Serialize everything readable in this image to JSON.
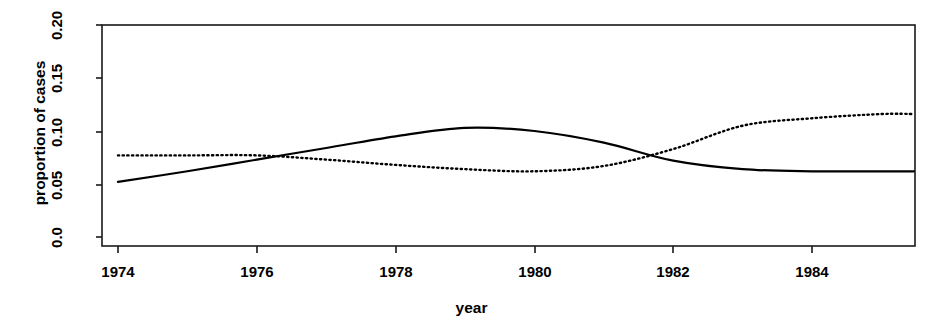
{
  "chart_data": {
    "type": "line",
    "title": "",
    "subtitle": "",
    "xlabel": "year",
    "ylabel": "proportion of cases",
    "x": [
      1974,
      1975,
      1976,
      1977,
      1978,
      1979,
      1980,
      1981,
      1982,
      1983,
      1984,
      1985
    ],
    "xlim": [
      1974,
      1985
    ],
    "ylim": [
      0.0,
      0.2
    ],
    "xticks": [
      1974,
      1976,
      1978,
      1980,
      1982,
      1984
    ],
    "xticklabels": [
      "1974",
      "1976",
      "1978",
      "1980",
      "1982",
      "1984"
    ],
    "yticks": [
      0.0,
      0.05,
      0.1,
      0.15,
      0.2
    ],
    "yticklabels": [
      "0.0",
      "0.05",
      "0.10",
      "0.15",
      "0.20"
    ],
    "grid": false,
    "legend": "none",
    "series": [
      {
        "name": "series-solid",
        "style": "solid",
        "color": "#000000",
        "values": [
          0.052,
          0.062,
          0.073,
          0.084,
          0.095,
          0.103,
          0.1,
          0.089,
          0.072,
          0.064,
          0.062,
          0.062
        ]
      },
      {
        "name": "series-dotted",
        "style": "dotted",
        "color": "#000000",
        "values": [
          0.077,
          0.077,
          0.077,
          0.073,
          0.068,
          0.064,
          0.062,
          0.067,
          0.083,
          0.105,
          0.112,
          0.116
        ]
      }
    ]
  },
  "axes": {
    "xlabel": "year",
    "ylabel": "proportion of cases",
    "ytick_0": "0.0",
    "ytick_1": "0.05",
    "ytick_2": "0.10",
    "ytick_3": "0.15",
    "ytick_4": "0.20",
    "xtick_0": "1974",
    "xtick_1": "1976",
    "xtick_2": "1978",
    "xtick_3": "1980",
    "xtick_4": "1982",
    "xtick_5": "1984"
  }
}
